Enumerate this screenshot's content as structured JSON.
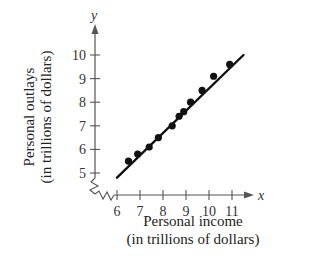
{
  "chart_data": {
    "type": "scatter",
    "title": "",
    "xlabel_line1": "Personal income",
    "xlabel_line2": "(in trillions of dollars)",
    "ylabel_line1": "Personal outlays",
    "ylabel_line2": "(in trillions of dollars)",
    "x_axis_symbol": "x",
    "y_axis_symbol": "y",
    "x_ticks": [
      6,
      7,
      8,
      9,
      10,
      11
    ],
    "y_ticks": [
      5,
      6,
      7,
      8,
      9,
      10
    ],
    "xlim": [
      5,
      11.8
    ],
    "ylim": [
      4,
      10.8
    ],
    "axis_breaks": true,
    "grid": false,
    "points": [
      {
        "x": 6.5,
        "y": 5.5
      },
      {
        "x": 6.9,
        "y": 5.8
      },
      {
        "x": 7.4,
        "y": 6.1
      },
      {
        "x": 7.8,
        "y": 6.5
      },
      {
        "x": 8.4,
        "y": 7.0
      },
      {
        "x": 8.7,
        "y": 7.4
      },
      {
        "x": 8.9,
        "y": 7.6
      },
      {
        "x": 9.2,
        "y": 8.0
      },
      {
        "x": 9.7,
        "y": 8.5
      },
      {
        "x": 10.2,
        "y": 9.1
      },
      {
        "x": 10.9,
        "y": 9.6
      }
    ],
    "trend_line": {
      "x1": 6.0,
      "y1": 4.8,
      "x2": 11.5,
      "y2": 10.0
    },
    "colors": {
      "axis": "#555555",
      "points": "#111111",
      "line": "#111111"
    }
  }
}
